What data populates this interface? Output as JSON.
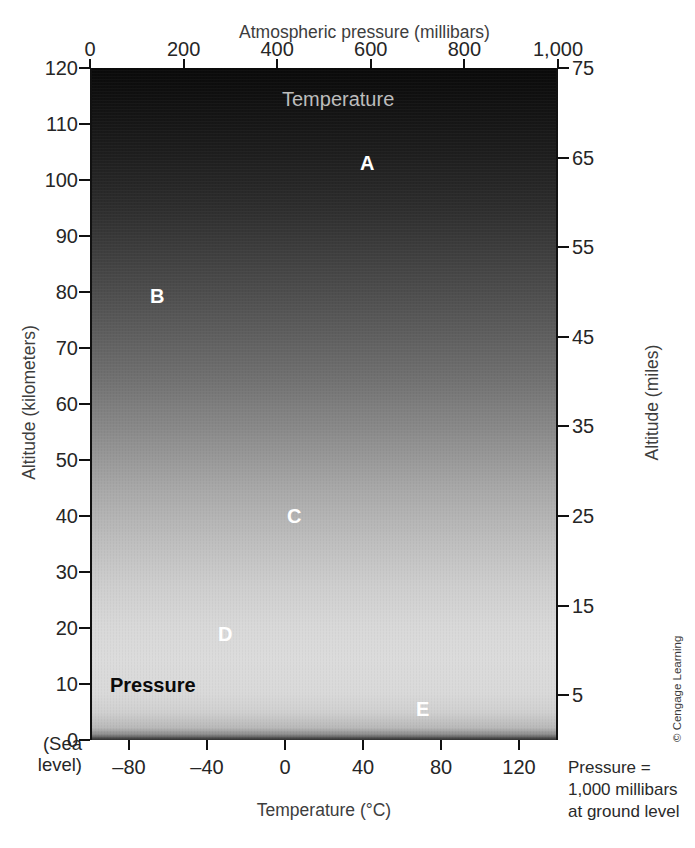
{
  "figure": {
    "title_top": "Atmospheric pressure (millibars)",
    "title_bottom": "Temperature (°C)",
    "title_left": "Altitude (kilometers)",
    "title_right": "Altitude (miles)",
    "sea_level_line1": "(Sea",
    "sea_level_line2": "level)",
    "caption": "Pressure = 1,000 millibars at ground level",
    "credit": "© Cengage Learning"
  },
  "axes": {
    "top": {
      "label": "Atmospheric pressure (millibars)",
      "ticks": [
        "0",
        "200",
        "400",
        "600",
        "800",
        "1,000"
      ],
      "values": [
        0,
        200,
        400,
        600,
        800,
        1000
      ],
      "min": 0,
      "max": 1000
    },
    "bottom": {
      "label": "Temperature (°C)",
      "ticks": [
        "–80",
        "–40",
        "0",
        "40",
        "80",
        "120"
      ],
      "values": [
        -80,
        -40,
        0,
        40,
        80,
        120
      ],
      "min": -100,
      "max": 140
    },
    "left": {
      "label": "Altitude (kilometers)",
      "ticks": [
        "120",
        "110",
        "100",
        "90",
        "80",
        "70",
        "60",
        "50",
        "40",
        "30",
        "20",
        "10",
        "0"
      ],
      "values": [
        120,
        110,
        100,
        90,
        80,
        70,
        60,
        50,
        40,
        30,
        20,
        10,
        0
      ],
      "min": 0,
      "max": 120
    },
    "right": {
      "label": "Altitude (miles)",
      "ticks": [
        "75",
        "65",
        "55",
        "45",
        "35",
        "25",
        "15",
        "5"
      ],
      "values": [
        75,
        65,
        55,
        45,
        35,
        25,
        15,
        5
      ],
      "min": 0,
      "max": 75
    }
  },
  "series_labels": {
    "temperature": "Temperature",
    "pressure": "Pressure"
  },
  "point_labels": [
    {
      "id": "A",
      "text": "A",
      "style": "white",
      "x_px": 358,
      "y_px": 152
    },
    {
      "id": "B",
      "text": "B",
      "style": "white",
      "x_px": 148,
      "y_px": 285
    },
    {
      "id": "C",
      "text": "C",
      "style": "white",
      "x_px": 285,
      "y_px": 505
    },
    {
      "id": "D",
      "text": "D",
      "style": "white",
      "x_px": 216,
      "y_px": 623
    },
    {
      "id": "E",
      "text": "E",
      "style": "white",
      "x_px": 414,
      "y_px": 698
    }
  ],
  "colors": {
    "temperature_curve": "#6e6e6e",
    "pressure_curve": "#080808",
    "reference_line": "#ffffff",
    "frame": "#111111",
    "text": "#262626"
  },
  "chart_data": {
    "type": "line",
    "title": "Atmospheric pressure (millibars)",
    "xlabel": "Temperature (°C)",
    "ylabel": "Altitude (kilometers)",
    "xlim": [
      -100,
      140
    ],
    "ylim": [
      0,
      120
    ],
    "grid": false,
    "legend": "inline labels on curves",
    "series": [
      {
        "name": "Temperature",
        "color": "#6e6e6e",
        "x_axis": "bottom",
        "x_label": "Temperature (°C)",
        "y_label": "Altitude (kilometers)",
        "points": [
          {
            "temperature_c": -15,
            "altitude_km": 0
          },
          {
            "temperature_c": -35,
            "altitude_km": 8
          },
          {
            "temperature_c": -57,
            "altitude_km": 14
          },
          {
            "temperature_c": -57,
            "altitude_km": 20
          },
          {
            "temperature_c": -52,
            "altitude_km": 26
          },
          {
            "temperature_c": -40,
            "altitude_km": 32
          },
          {
            "temperature_c": -25,
            "altitude_km": 40
          },
          {
            "temperature_c": -8,
            "altitude_km": 46
          },
          {
            "temperature_c": -2,
            "altitude_km": 50
          },
          {
            "temperature_c": -10,
            "altitude_km": 56
          },
          {
            "temperature_c": -30,
            "altitude_km": 63
          },
          {
            "temperature_c": -55,
            "altitude_km": 70
          },
          {
            "temperature_c": -80,
            "altitude_km": 76
          },
          {
            "temperature_c": -90,
            "altitude_km": 80
          },
          {
            "temperature_c": -84,
            "altitude_km": 84
          },
          {
            "temperature_c": -66,
            "altitude_km": 90
          },
          {
            "temperature_c": -40,
            "altitude_km": 97
          },
          {
            "temperature_c": -8,
            "altitude_km": 105
          },
          {
            "temperature_c": 30,
            "altitude_km": 113
          },
          {
            "temperature_c": 62,
            "altitude_km": 120
          }
        ]
      },
      {
        "name": "Pressure",
        "color": "#080808",
        "x_axis": "top",
        "x_label": "Atmospheric pressure (millibars)",
        "y_label": "Altitude (kilometers)",
        "points": [
          {
            "pressure_mb": 1000,
            "altitude_km": 0
          },
          {
            "pressure_mb": 900,
            "altitude_km": 1
          },
          {
            "pressure_mb": 800,
            "altitude_km": 2
          },
          {
            "pressure_mb": 700,
            "altitude_km": 3
          },
          {
            "pressure_mb": 600,
            "altitude_km": 4.2
          },
          {
            "pressure_mb": 500,
            "altitude_km": 5.5
          },
          {
            "pressure_mb": 400,
            "altitude_km": 7.2
          },
          {
            "pressure_mb": 300,
            "altitude_km": 9.2
          },
          {
            "pressure_mb": 200,
            "altitude_km": 11.8
          },
          {
            "pressure_mb": 100,
            "altitude_km": 16
          },
          {
            "pressure_mb": 50,
            "altitude_km": 20.5
          },
          {
            "pressure_mb": 25,
            "altitude_km": 25
          },
          {
            "pressure_mb": 10,
            "altitude_km": 31
          },
          {
            "pressure_mb": 5,
            "altitude_km": 36
          },
          {
            "pressure_mb": 1,
            "altitude_km": 48
          },
          {
            "pressure_mb": 0.1,
            "altitude_km": 65
          },
          {
            "pressure_mb": 0.01,
            "altitude_km": 80
          },
          {
            "pressure_mb": 0.001,
            "altitude_km": 96
          },
          {
            "pressure_mb": 0.0002,
            "altitude_km": 120
          }
        ]
      }
    ],
    "reference_lines": [
      {
        "name": "mesopause",
        "altitude_km": 80,
        "label": "B"
      },
      {
        "name": "stratopause",
        "altitude_km": 50,
        "label": "C"
      },
      {
        "name": "tropopause",
        "altitude_km": 20,
        "label": "D"
      }
    ],
    "annotations": [
      {
        "label": "A",
        "region": "thermosphere",
        "altitude_km": 100
      },
      {
        "label": "B",
        "region": "mesopause",
        "altitude_km": 80
      },
      {
        "label": "C",
        "region": "stratopause",
        "altitude_km": 50
      },
      {
        "label": "D",
        "region": "tropopause",
        "altitude_km": 20
      },
      {
        "label": "E",
        "region": "pressure curve near surface",
        "altitude_km": 5
      }
    ]
  }
}
